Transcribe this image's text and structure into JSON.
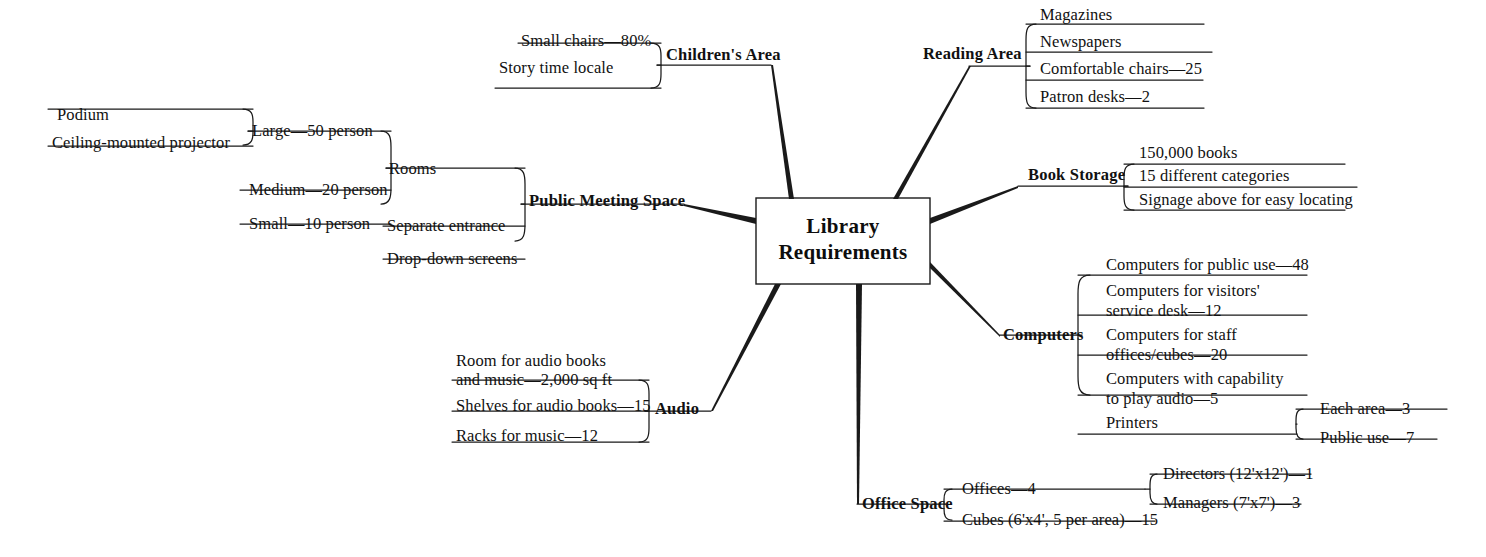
{
  "diagram": {
    "type": "mind-map",
    "title": "Library Requirements",
    "center": {
      "line1": "Library",
      "line2": "Requirements"
    },
    "colors": {
      "background": "#ffffff",
      "stroke": "#1a1a1a",
      "text": "#111111"
    },
    "branches": [
      {
        "id": "childrens-area",
        "label": "Children's Area",
        "side": "left",
        "children": [
          {
            "label": "Small chairs—80%"
          },
          {
            "label": "Story time locale"
          }
        ]
      },
      {
        "id": "reading-area",
        "label": "Reading Area",
        "side": "right",
        "children": [
          {
            "label": "Magazines"
          },
          {
            "label": "Newspapers"
          },
          {
            "label": "Comfortable chairs—25"
          },
          {
            "label": "Patron desks—2"
          }
        ]
      },
      {
        "id": "book-storage",
        "label": "Book Storage",
        "side": "right",
        "children": [
          {
            "label": "150,000 books"
          },
          {
            "label": "15 different categories"
          },
          {
            "label": "Signage above for easy locating"
          }
        ]
      },
      {
        "id": "public-meeting-space",
        "label": "Public Meeting Space",
        "side": "left",
        "children": [
          {
            "label": "Rooms",
            "children": [
              {
                "label": "Large—50 person",
                "children": [
                  {
                    "label": "Podium"
                  },
                  {
                    "label": "Ceiling-mounted projector"
                  }
                ]
              },
              {
                "label": "Medium—20 person"
              },
              {
                "label": "Small—10 person"
              }
            ]
          },
          {
            "label": "Separate entrance"
          },
          {
            "label": "Drop-down screens"
          }
        ]
      },
      {
        "id": "computers",
        "label": "Computers",
        "side": "right",
        "children": [
          {
            "label": "Computers for public use—48"
          },
          {
            "label": "Computers for visitors'\nservice desk—12"
          },
          {
            "label": "Computers for staff\noffices/cubes—20"
          },
          {
            "label": "Computers with capability\nto play audio—5"
          },
          {
            "label": "Printers",
            "children": [
              {
                "label": "Each area—3"
              },
              {
                "label": "Public use—7"
              }
            ]
          }
        ]
      },
      {
        "id": "audio",
        "label": "Audio",
        "side": "left",
        "children": [
          {
            "label": "Room for audio books\nand music—2,000 sq ft"
          },
          {
            "label": "Shelves for audio books—15"
          },
          {
            "label": "Racks for music—12"
          }
        ]
      },
      {
        "id": "office-space",
        "label": "Office Space",
        "side": "right",
        "children": [
          {
            "label": "Offices—4",
            "children": [
              {
                "label": "Directors (12'x12')—1"
              },
              {
                "label": "Managers (7'x7')—3"
              }
            ]
          },
          {
            "label": "Cubes (6'x4', 5 per area)—15"
          }
        ]
      }
    ],
    "labels": {
      "childrens_area": "Children's Area",
      "ca_small_chairs": "Small chairs—80%",
      "ca_story_time": "Story time locale",
      "reading_area": "Reading Area",
      "ra_magazines": "Magazines",
      "ra_newspapers": "Newspapers",
      "ra_chairs": "Comfortable chairs—25",
      "ra_desks": "Patron desks—2",
      "book_storage": "Book Storage",
      "bs_books": "150,000 books",
      "bs_categories": "15 different categories",
      "bs_signage": "Signage above for easy locating",
      "public_meeting_space": "Public Meeting Space",
      "pms_rooms": "Rooms",
      "pms_separate_entrance": "Separate entrance",
      "pms_dropdown_screens": "Drop-down screens",
      "rooms_large": "Large—50 person",
      "rooms_medium": "Medium—20 person",
      "rooms_small": "Small—10 person",
      "large_podium": "Podium",
      "large_projector": "Ceiling-mounted projector",
      "computers": "Computers",
      "c_public": "Computers for public use—48",
      "c_visitors_1": "Computers for visitors'",
      "c_visitors_2": "service desk—12",
      "c_staff_1": "Computers for staff",
      "c_staff_2": "offices/cubes—20",
      "c_audio_1": "Computers with capability",
      "c_audio_2": "to play audio—5",
      "c_printers": "Printers",
      "p_each_area": "Each area—3",
      "p_public_use": "Public use—7",
      "audio": "Audio",
      "a_room_1": "Room for audio books",
      "a_room_2": "and music—2,000 sq ft",
      "a_shelves": "Shelves for audio books—15",
      "a_racks": "Racks for music—12",
      "office_space": "Office Space",
      "os_offices": "Offices—4",
      "os_cubes": "Cubes (6'x4', 5 per area)—15",
      "o_directors": "Directors (12'x12')—1",
      "o_managers": "Managers (7'x7')—3"
    }
  }
}
